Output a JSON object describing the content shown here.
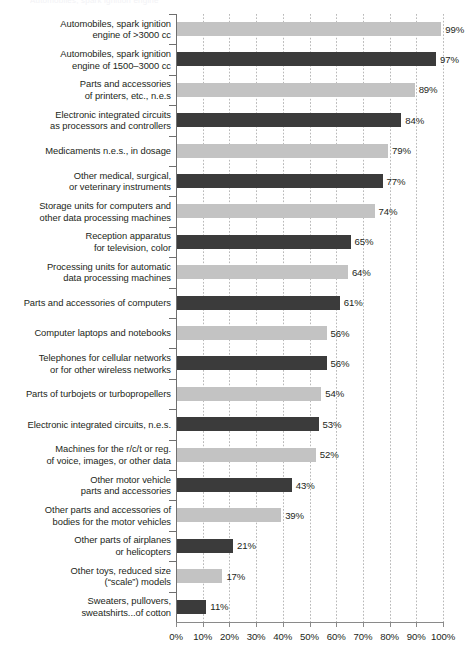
{
  "top_artifact": "Automobiles, spark ignition engine",
  "chart_data": {
    "type": "bar",
    "orientation": "horizontal",
    "title": "",
    "subtitle": "",
    "xlabel": "",
    "ylabel": "",
    "xlim": [
      0,
      100
    ],
    "xticks": [
      0,
      10,
      20,
      30,
      40,
      50,
      60,
      70,
      80,
      90,
      100
    ],
    "xtick_labels": [
      "0%",
      "10%",
      "20%",
      "30%",
      "40%",
      "50%",
      "60%",
      "70%",
      "80%",
      "90%",
      "100%"
    ],
    "grid": true,
    "legend": "none",
    "value_suffix": "%",
    "colors": {
      "light_bar": "#c3c3c3",
      "dark_bar": "#3b3b3b",
      "axis": "#8a8a8a",
      "gridline": "#b9b9b9",
      "text": "#231f20"
    },
    "categories": [
      "Automobiles, spark ignition engine of >3000 cc",
      "Automobiles, spark ignition engine of 1500–3000 cc",
      "Parts and accessories of printers, etc., n.e.s",
      "Electronic integrated circuits as processors and controllers",
      "Medicaments n.e.s., in dosage",
      "Other medical, surgical, or veterinary instruments",
      "Storage units for computers and other data processing machines",
      "Reception apparatus for television, color",
      "Processing units for automatic data processing machines",
      "Parts and accessories of computers",
      "Computer laptops and notebooks",
      "Telephones for cellular networks or for other wireless networks",
      "Parts of turbojets or turbopropellers",
      "Electronic integrated circuits, n.e.s.",
      "Machines for the r/c/t or reg. of voice, images, or other data",
      "Other motor vehicle parts and accessories",
      "Other parts and accessories of bodies for the motor vehicles",
      "Other parts of airplanes or helicopters",
      "Other toys, reduced size (“scale”) models",
      "Sweaters, pullovers, sweatshirts...of cotton"
    ],
    "values": [
      99,
      97,
      89,
      84,
      79,
      77,
      74,
      65,
      64,
      61,
      56,
      56,
      54,
      53,
      52,
      43,
      39,
      21,
      17,
      11
    ]
  },
  "rows": [
    {
      "label_lines": [
        "Automobiles, spark ignition",
        "engine of >3000 cc"
      ],
      "value": 99,
      "value_label": "99%",
      "shade": "light"
    },
    {
      "label_lines": [
        "Automobiles, spark ignition",
        "engine of 1500–3000 cc"
      ],
      "value": 97,
      "value_label": "97%",
      "shade": "dark"
    },
    {
      "label_lines": [
        "Parts and accessories",
        "of printers, etc., n.e.s"
      ],
      "value": 89,
      "value_label": "89%",
      "shade": "light"
    },
    {
      "label_lines": [
        "Electronic integrated circuits",
        "as processors and controllers"
      ],
      "value": 84,
      "value_label": "84%",
      "shade": "dark"
    },
    {
      "label_lines": [
        "Medicaments n.e.s., in dosage"
      ],
      "value": 79,
      "value_label": "79%",
      "shade": "light"
    },
    {
      "label_lines": [
        "Other medical, surgical,",
        "or veterinary instruments"
      ],
      "value": 77,
      "value_label": "77%",
      "shade": "dark"
    },
    {
      "label_lines": [
        "Storage units for computers and",
        "other data processing machines"
      ],
      "value": 74,
      "value_label": "74%",
      "shade": "light"
    },
    {
      "label_lines": [
        "Reception apparatus",
        "for television, color"
      ],
      "value": 65,
      "value_label": "65%",
      "shade": "dark"
    },
    {
      "label_lines": [
        "Processing units for automatic",
        "data processing machines"
      ],
      "value": 64,
      "value_label": "64%",
      "shade": "light"
    },
    {
      "label_lines": [
        "Parts and accessories of computers"
      ],
      "value": 61,
      "value_label": "61%",
      "shade": "dark"
    },
    {
      "label_lines": [
        "Computer laptops and notebooks"
      ],
      "value": 56,
      "value_label": "56%",
      "shade": "light"
    },
    {
      "label_lines": [
        "Telephones for cellular networks",
        "or for other wireless networks"
      ],
      "value": 56,
      "value_label": "56%",
      "shade": "dark"
    },
    {
      "label_lines": [
        "Parts of turbojets or turbopropellers"
      ],
      "value": 54,
      "value_label": "54%",
      "shade": "light"
    },
    {
      "label_lines": [
        "Electronic integrated circuits, n.e.s."
      ],
      "value": 53,
      "value_label": "53%",
      "shade": "dark"
    },
    {
      "label_lines": [
        "Machines for the r/c/t or reg.",
        "of voice, images, or other data"
      ],
      "value": 52,
      "value_label": "52%",
      "shade": "light"
    },
    {
      "label_lines": [
        "Other motor vehicle",
        "parts and accessories"
      ],
      "value": 43,
      "value_label": "43%",
      "shade": "dark"
    },
    {
      "label_lines": [
        "Other parts and accessories of",
        "bodies for the motor vehicles"
      ],
      "value": 39,
      "value_label": "39%",
      "shade": "light"
    },
    {
      "label_lines": [
        "Other parts of airplanes",
        "or helicopters"
      ],
      "value": 21,
      "value_label": "21%",
      "shade": "dark"
    },
    {
      "label_lines": [
        "Other toys, reduced size",
        "(“scale”) models"
      ],
      "value": 17,
      "value_label": "17%",
      "shade": "light"
    },
    {
      "label_lines": [
        "Sweaters, pullovers,",
        "sweatshirts...of cotton"
      ],
      "value": 11,
      "value_label": "11%",
      "shade": "dark"
    }
  ]
}
